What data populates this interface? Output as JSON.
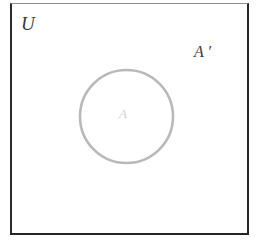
{
  "figure": {
    "type": "venn-diagram",
    "background_color": "#ffffff"
  },
  "universe": {
    "label": "U",
    "border_color": "#262626",
    "fill_color": "#ffffff"
  },
  "set_a": {
    "label": "A",
    "stroke_color": "#b9b9b9",
    "label_color": "#d2d2d2",
    "fill_color": "#ffffff"
  },
  "complement": {
    "label": "A ′",
    "label_color": "#3c3c3e"
  }
}
